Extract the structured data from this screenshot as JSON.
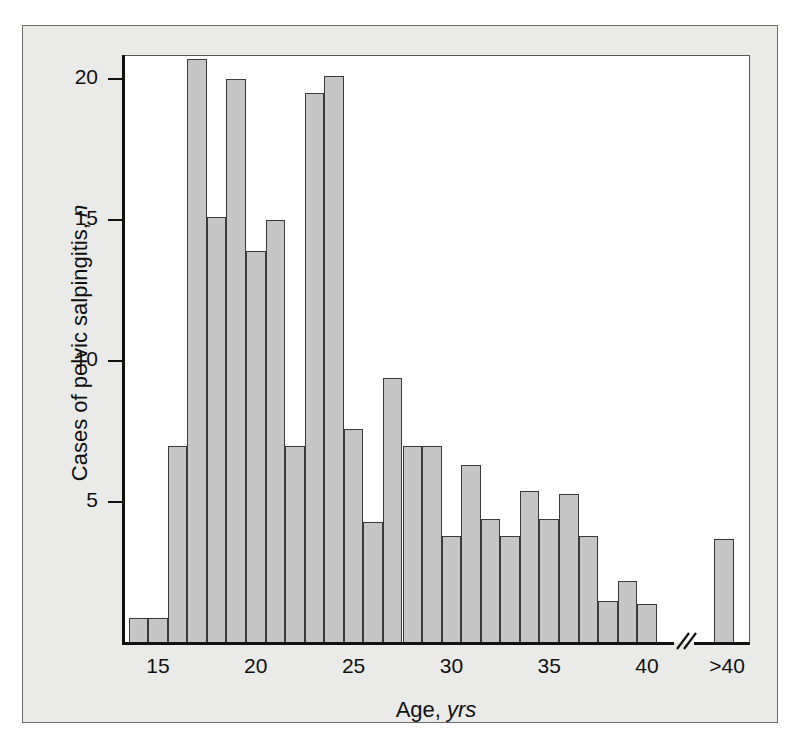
{
  "figure": {
    "background_color": "#eaeae8",
    "plot_background_color": "#ffffff",
    "bar_fill_color": "#c5c5c5",
    "bar_edge_color": "#3a3a3a",
    "axis_color": "#111111"
  },
  "chart_data": {
    "type": "bar",
    "title": "",
    "subtitle": "",
    "xlabel": "Age, yrs",
    "ylabel": "Cases of pelvic salpingitis, n",
    "xlabel_plain": "Age,",
    "xlabel_italic": "yrs",
    "ylabel_plain": "Cases of pelvic salpingitis,",
    "ylabel_italic": "n",
    "grid": false,
    "legend": null,
    "ylim": [
      0,
      21.5
    ],
    "xlim": [
      13.5,
      43.5
    ],
    "ytick_labels": [
      "5",
      "10",
      "15",
      "20"
    ],
    "ytick_values": [
      5,
      10,
      15,
      20
    ],
    "xtick_labels": [
      "15",
      "20",
      "25",
      "30",
      "35",
      "40",
      ">40"
    ],
    "xtick_values": [
      15,
      20,
      25,
      30,
      35,
      40,
      42.6
    ],
    "axis_break": true,
    "axis_break_label": "//",
    "axis_break_position": 41.5,
    "bin_width": 1,
    "categories": [
      14,
      15,
      16,
      17,
      18,
      19,
      20,
      21,
      22,
      23,
      24,
      25,
      26,
      27,
      28,
      29,
      30,
      31,
      32,
      33,
      34,
      35,
      36,
      37,
      38,
      39,
      40,
      ">40"
    ],
    "values": [
      0.9,
      0.9,
      7.0,
      20.7,
      15.1,
      20.0,
      13.9,
      15.0,
      7.0,
      19.5,
      20.1,
      7.6,
      4.3,
      9.4,
      7.0,
      7.0,
      3.8,
      6.3,
      4.4,
      3.8,
      5.4,
      4.4,
      5.3,
      3.8,
      1.5,
      2.2,
      1.4,
      3.7
    ]
  }
}
